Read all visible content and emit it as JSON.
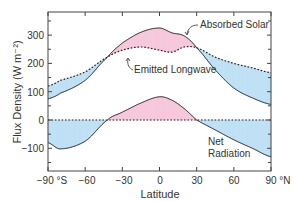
{
  "chart_data": {
    "type": "line",
    "title": "",
    "xlabel": "Latitude",
    "ylabel": "Flux Density (W m⁻²)",
    "xlim": [
      -90,
      90
    ],
    "ylim": [
      -170,
      390
    ],
    "grid": false,
    "x_ticks": [
      -90,
      -60,
      -30,
      0,
      30,
      60,
      90
    ],
    "x_tick_labels": [
      "−90 °S",
      "−60",
      "−30",
      "0",
      "30",
      "60",
      "90 °N"
    ],
    "y_ticks": [
      -100,
      0,
      100,
      200,
      300
    ],
    "y_tick_labels": [
      "−100",
      "0",
      "100",
      "200",
      "300"
    ],
    "x": [
      -90,
      -80,
      -60,
      -42,
      -30,
      -15,
      0,
      10,
      20,
      30,
      45,
      60,
      75,
      90
    ],
    "series": [
      {
        "name": "Absorbed Solar",
        "style": "solid",
        "values": [
          75,
          95,
          140,
          222,
          272,
          310,
          325,
          308,
          297,
          255,
          177,
          113,
          78,
          55
        ]
      },
      {
        "name": "Emitted Longwave",
        "style": "dotted",
        "values": [
          120,
          140,
          170,
          222,
          247,
          258,
          247,
          240,
          258,
          255,
          222,
          200,
          184,
          167
        ]
      },
      {
        "name": "Net Radiation",
        "style": "solid",
        "values": [
          -80,
          -102,
          -75,
          0,
          28,
          60,
          82,
          70,
          40,
          0,
          -35,
          -70,
          -100,
          -130
        ]
      }
    ],
    "zero_line": {
      "value": 0,
      "style": "dotted"
    },
    "fills": {
      "surplus_color": "#f7c8dc",
      "deficit_color": "#bfe0f5"
    },
    "annotations": [
      {
        "text": "Absorbed Solar",
        "target": "Absorbed Solar"
      },
      {
        "text": "Emitted Longwave",
        "target": "Emitted Longwave"
      },
      {
        "text": "Net",
        "target": "Net Radiation"
      },
      {
        "text": "Radiation",
        "target": "Net Radiation"
      }
    ],
    "legend": "none (curves labeled by annotations)"
  },
  "labels": {
    "absorbed_solar": "Absorbed Solar",
    "emitted_longwave": "Emitted Longwave",
    "net_line1": "Net",
    "net_line2": "Radiation",
    "xlabel": "Latitude",
    "ylabel": "Flux Density (W m⁻²)"
  },
  "ticks": {
    "x": [
      "−90 °S",
      "−60",
      "−30",
      "0",
      "30",
      "60",
      "90 °N"
    ],
    "y": [
      "300",
      "200",
      "100",
      "0",
      "−100"
    ]
  }
}
